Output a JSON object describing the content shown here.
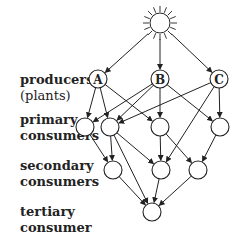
{
  "labels": {
    "producers": "producers",
    "plants": "(plants)",
    "primary1": "primary",
    "primary2": "consumers",
    "secondary1": "secondary",
    "secondary2": "consumers",
    "tertiary1": "tertiary",
    "tertiary2": "consumer"
  },
  "nodes": [
    {
      "id": "sun",
      "type": "sun",
      "label": ""
    },
    {
      "id": "A",
      "type": "producer",
      "label": "A"
    },
    {
      "id": "B",
      "type": "producer",
      "label": "B"
    },
    {
      "id": "C",
      "type": "producer",
      "label": "C"
    },
    {
      "id": "P1",
      "type": "primary",
      "label": ""
    },
    {
      "id": "P2",
      "type": "primary",
      "label": ""
    },
    {
      "id": "P3",
      "type": "primary",
      "label": ""
    },
    {
      "id": "P4",
      "type": "primary",
      "label": ""
    },
    {
      "id": "S1",
      "type": "secondary",
      "label": ""
    },
    {
      "id": "S2",
      "type": "secondary",
      "label": ""
    },
    {
      "id": "S3",
      "type": "secondary",
      "label": ""
    },
    {
      "id": "T",
      "type": "tertiary",
      "label": ""
    }
  ],
  "edges": [
    [
      "sun",
      "A"
    ],
    [
      "sun",
      "B"
    ],
    [
      "sun",
      "C"
    ],
    [
      "A",
      "P1"
    ],
    [
      "A",
      "P2"
    ],
    [
      "A",
      "P3"
    ],
    [
      "B",
      "P1"
    ],
    [
      "B",
      "P2"
    ],
    [
      "B",
      "P3"
    ],
    [
      "B",
      "P4"
    ],
    [
      "C",
      "P2"
    ],
    [
      "C",
      "P4"
    ],
    [
      "C",
      "S2"
    ],
    [
      "P1",
      "S1"
    ],
    [
      "P2",
      "S1"
    ],
    [
      "P2",
      "S2"
    ],
    [
      "P2",
      "T"
    ],
    [
      "P3",
      "S2"
    ],
    [
      "P3",
      "S3"
    ],
    [
      "P4",
      "S3"
    ],
    [
      "S1",
      "T"
    ],
    [
      "S2",
      "T"
    ],
    [
      "S3",
      "T"
    ]
  ]
}
